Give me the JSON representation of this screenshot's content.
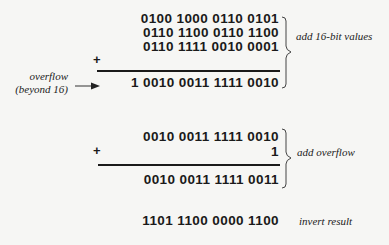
{
  "block1": {
    "operands": [
      "0100 1000 0110 0101",
      "0110 1100 0110 1100",
      "0110 1111 0010 0001"
    ],
    "operator": "+",
    "result": "1 0010 0011 1111 0010",
    "brace_label": "add 16-bit values",
    "overflow_label_line1": "overflow",
    "overflow_label_line2": "(beyond 16)"
  },
  "block2": {
    "operands": [
      "0010 0011 1111 0010",
      "1"
    ],
    "operator": "+",
    "result": "0010 0011 1111 0011",
    "brace_label": "add overflow"
  },
  "block3": {
    "value": "1101 1100 0000 1100",
    "label": "invert result"
  }
}
